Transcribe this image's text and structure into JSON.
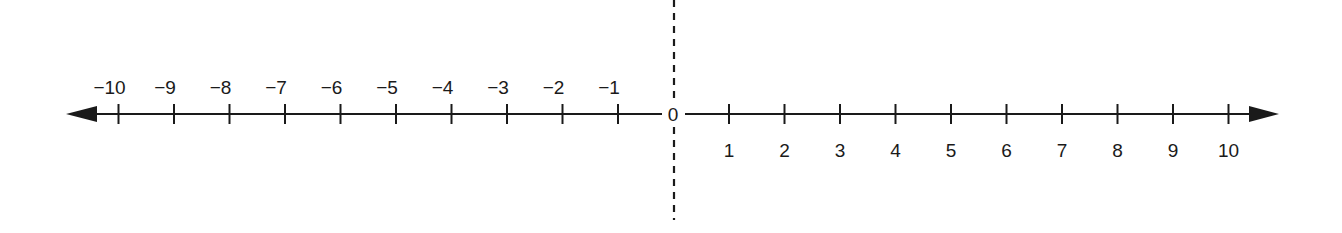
{
  "diagram": {
    "type": "number-line",
    "min": -10,
    "max": 10,
    "origin_label": "0",
    "negative_labels": [
      "−10",
      "−9",
      "−8",
      "−7",
      "−6",
      "−5",
      "−4",
      "−3",
      "−2",
      "−1"
    ],
    "positive_labels": [
      "1",
      "2",
      "3",
      "4",
      "5",
      "6",
      "7",
      "8",
      "9",
      "10"
    ],
    "negative_values": [
      -10,
      -9,
      -8,
      -7,
      -6,
      -5,
      -4,
      -3,
      -2,
      -1
    ],
    "positive_values": [
      1,
      2,
      3,
      4,
      5,
      6,
      7,
      8,
      9,
      10
    ],
    "negative_labels_position": "above",
    "positive_labels_position": "below",
    "arrows": [
      "left",
      "right"
    ],
    "vertical_divider": "dashed line through 0",
    "colors": {
      "line": "#1a1a1a",
      "background": "#ffffff"
    }
  }
}
